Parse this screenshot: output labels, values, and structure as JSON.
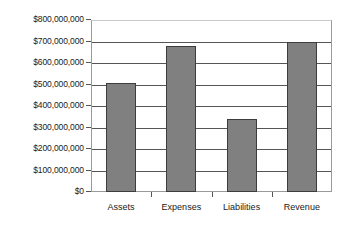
{
  "chart_data": {
    "type": "bar",
    "title": "",
    "subtitle": "",
    "xlabel": "",
    "ylabel": "",
    "categories": [
      "Assets",
      "Expenses",
      "Liabilities",
      "Revenue"
    ],
    "values": [
      505000000,
      680000000,
      340000000,
      697000000
    ],
    "series": [
      {
        "name": "",
        "values": [
          505000000,
          680000000,
          340000000,
          697000000
        ]
      }
    ],
    "ylim": [
      0,
      800000000
    ],
    "ytick_values": [
      0,
      100000000,
      200000000,
      300000000,
      400000000,
      500000000,
      600000000,
      700000000,
      800000000
    ],
    "ytick_labels": [
      "$0",
      "$100,000,000",
      "$200,000,000",
      "$300,000,000",
      "$400,000,000",
      "$500,000,000",
      "$600,000,000",
      "$700,000,000",
      "$800,000,000"
    ],
    "grid": true,
    "grid_axis": "y",
    "legend": false,
    "legend_position": "none",
    "bar_color": "#808080",
    "bar_border_color": "#3d3d3d",
    "gridline_color": "#555555",
    "plot_border_color": "#9a9a9a",
    "background_color": "#ffffff",
    "annotations": []
  }
}
